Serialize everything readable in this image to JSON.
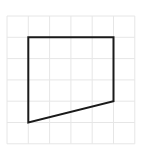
{
  "diagram": {
    "type": "grid-polygon",
    "grid": {
      "origin_x": 7,
      "origin_y": 16,
      "cell_size": 21.3,
      "columns": 6,
      "rows": 6,
      "line_color": "#e6e6e6"
    },
    "shape": {
      "name": "quadrilateral",
      "stroke_color": "#1a1a1a",
      "stroke_width": 2,
      "fill": "none",
      "vertices_grid": [
        [
          1,
          1
        ],
        [
          5,
          1
        ],
        [
          5,
          4
        ],
        [
          1,
          5
        ]
      ]
    }
  }
}
